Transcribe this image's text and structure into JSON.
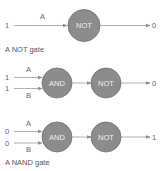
{
  "diagrams": [
    {
      "caption": "A NOT gate",
      "inputs": [
        {
          "value": "1",
          "label": "A"
        }
      ],
      "gates": [
        "NOT"
      ],
      "output": "0"
    },
    {
      "caption": "",
      "inputs": [
        {
          "value": "1",
          "label": "A"
        },
        {
          "value": "1",
          "label": "B"
        }
      ],
      "gates": [
        "AND",
        "NOT"
      ],
      "output": "0"
    },
    {
      "caption": "A NAND gate",
      "inputs": [
        {
          "value": "0",
          "label": "A"
        },
        {
          "value": "0",
          "label": "B"
        }
      ],
      "gates": [
        "AND",
        "NOT"
      ],
      "output": "1"
    }
  ],
  "colors": {
    "gate_fill": "#8c8c8c",
    "gate_stroke": "#6e6e6e",
    "wire": "#9a9a9a",
    "text": "#555555"
  }
}
